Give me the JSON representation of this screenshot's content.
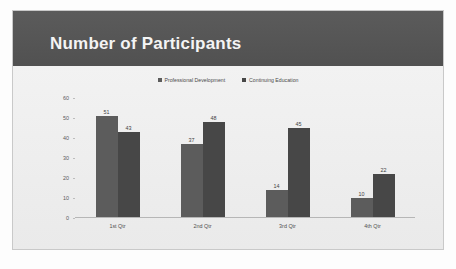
{
  "slide": {
    "title": "Number of Participants",
    "header_color": "#555555",
    "body_color": "#efefef"
  },
  "chart_data": {
    "type": "bar",
    "title": "Number of Participants",
    "categories": [
      "1st Qtr",
      "2nd Qtr",
      "3rd Qtr",
      "4th Qtr"
    ],
    "series": [
      {
        "name": "Professional Development",
        "color": "#5c5c5c",
        "values": [
          51,
          37,
          14,
          10
        ]
      },
      {
        "name": "Continuing Education",
        "color": "#474747",
        "values": [
          43,
          48,
          45,
          22
        ]
      }
    ],
    "xlabel": "",
    "ylabel": "",
    "ylim": [
      0,
      60
    ],
    "yticks": [
      60,
      50,
      40,
      30,
      20,
      10,
      0
    ],
    "grid": false,
    "legend_position": "top",
    "data_labels": true
  }
}
